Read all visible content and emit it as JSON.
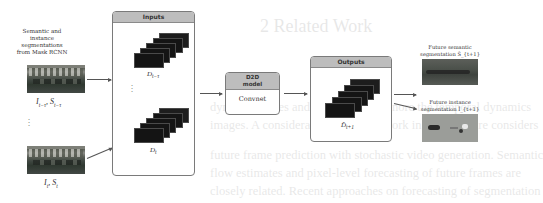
{
  "background": {
    "heading": "2   Related Work",
    "lines": [
      "dynamic scenes and consequently ignore the temporal dynamics",
      "images. A considerable amount of work in the literature considers",
      "future frame prediction with stochastic video generation. Semantic",
      "flow estimates and pixel-level forecasting of future frames are",
      "closely related. Recent approaches on forecasting of segmentation"
    ]
  },
  "source": {
    "caption_lines": [
      "Semantic and",
      "instance",
      "segmentations",
      "from Mask RCNN"
    ],
    "frame_past_label": "I_{t-τ}, S_{t-τ}",
    "frame_now_label": "I_t, S_t",
    "ellipsis": "⋮"
  },
  "inputs": {
    "title": "Inputs",
    "stack_past_label": "D_{t-τ}",
    "stack_now_label": "D_t",
    "ellipsis": "⋮",
    "frames_per_stack": 5
  },
  "model": {
    "title_line1": "D2D",
    "title_line2": "model",
    "body": "Convnet"
  },
  "outputs": {
    "title": "Outputs",
    "stack_label": "D̂_{t+1}",
    "frames_per_stack": 5
  },
  "results": {
    "semantic_caption_line1": "Future semantic",
    "semantic_caption_line2": "segmentation Ŝ_{t+1}",
    "instance_caption_line1": "Future instance",
    "instance_caption_line2": "segmentation Î_{t+1}"
  },
  "colors": {
    "panel_header": "#bdbdbd",
    "panel_border": "#7a7a7a",
    "frame_fill": "#141414",
    "arrow": "#555555"
  }
}
